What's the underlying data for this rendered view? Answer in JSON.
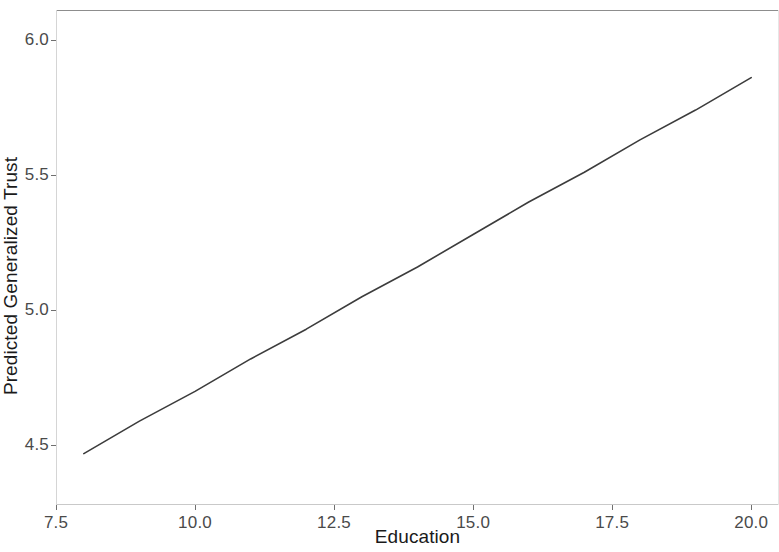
{
  "figure": {
    "width": 779,
    "height": 552,
    "background": "#ffffff"
  },
  "chart_data": {
    "type": "line",
    "title": "",
    "subtitle": "",
    "xlabel": "Education",
    "ylabel": "Predicted Generalized Trust",
    "xlim": [
      7.5,
      20.5
    ],
    "ylim": [
      4.28,
      6.11
    ],
    "xticks": [
      7.5,
      10.0,
      12.5,
      15.0,
      17.5,
      20.0
    ],
    "xtick_labels": [
      "7.5",
      "10.0",
      "12.5",
      "15.0",
      "17.5",
      "20.0"
    ],
    "yticks": [
      4.5,
      5.0,
      5.5,
      6.0
    ],
    "ytick_labels": [
      "4.5",
      "5.0",
      "5.5",
      "6.0"
    ],
    "grid": false,
    "legend": false,
    "legend_position": "none",
    "line_color": "#3c3c3c",
    "line_width": 1.6,
    "series": [
      {
        "name": "Predicted Generalized Trust",
        "x": [
          8.0,
          9.0,
          10.0,
          11.0,
          12.0,
          13.0,
          14.0,
          15.0,
          16.0,
          17.0,
          18.0,
          19.0,
          20.0
        ],
        "values": [
          4.47,
          4.59,
          4.7,
          4.82,
          4.93,
          5.05,
          5.16,
          5.28,
          5.4,
          5.51,
          5.63,
          5.74,
          5.86
        ]
      }
    ],
    "annotations": []
  },
  "axes": {
    "y_title": "Predicted Generalized Trust",
    "x_title": "Education"
  }
}
